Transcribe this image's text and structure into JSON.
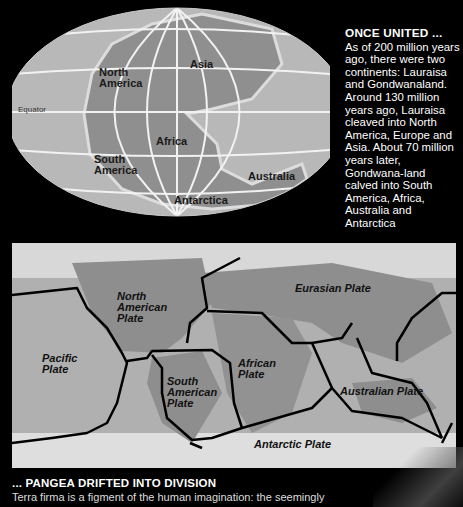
{
  "top_map": {
    "labels": {
      "north_america": "North\nAmerica",
      "asia": "Asia",
      "equator": "Equator",
      "africa": "Africa",
      "south_america": "South\nAmerica",
      "australia": "Australia",
      "antarctica": "Antarctica"
    }
  },
  "side_panel": {
    "title": "ONCE UNITED ...",
    "body": "As of 200 million years ago, there were two continents: Lauraisa and Gondwanaland. Around 130 million years ago, Lauraisa cleaved into North America, Europe and Asia. About 70 million years later, Gondwana-land calved into South America, Africa, Australia and Antarctica"
  },
  "bottom_map": {
    "plates": {
      "north_american": "North\nAmerican\nPlate",
      "eurasian": "Eurasian Plate",
      "pacific": "Pacific\nPlate",
      "south_american": "South\nAmerican\nPlate",
      "african": "African\nPlate",
      "australian": "Australian Plate",
      "antarctic": "Antarctic Plate"
    }
  },
  "caption": {
    "title": "... PANGEA DRIFTED INTO DIVISION",
    "body": "Terra firma is a figment of the human imagination: the seemingly"
  },
  "colors": {
    "background": "#000000",
    "ocean": "#b5b5b5",
    "land": "#8e8e8e",
    "grid": "#f2f2f2",
    "boundary": "#000000",
    "text": "#ffffff"
  }
}
